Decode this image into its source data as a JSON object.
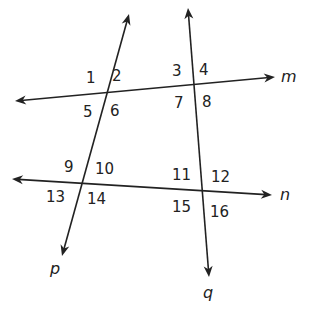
{
  "diagram": {
    "stroke_color": "#222222",
    "background": "#ffffff",
    "lines": [
      {
        "name": "m",
        "label": "m",
        "x1": 15,
        "y1": 101,
        "x2": 275,
        "y2": 77
      },
      {
        "name": "n",
        "label": "n",
        "x1": 12,
        "y1": 179,
        "x2": 272,
        "y2": 195
      },
      {
        "name": "p",
        "label": "p",
        "x1": 129,
        "y1": 14,
        "x2": 62,
        "y2": 256
      },
      {
        "name": "q",
        "label": "q",
        "x1": 188,
        "y1": 8,
        "x2": 209,
        "y2": 277
      }
    ],
    "angle_labels": [
      {
        "n": "1",
        "x": 86,
        "y": 83
      },
      {
        "n": "2",
        "x": 112,
        "y": 81
      },
      {
        "n": "3",
        "x": 172,
        "y": 76
      },
      {
        "n": "4",
        "x": 199,
        "y": 75
      },
      {
        "n": "5",
        "x": 83,
        "y": 117
      },
      {
        "n": "6",
        "x": 110,
        "y": 116
      },
      {
        "n": "7",
        "x": 174,
        "y": 108
      },
      {
        "n": "8",
        "x": 202,
        "y": 107
      },
      {
        "n": "9",
        "x": 64,
        "y": 172
      },
      {
        "n": "10",
        "x": 95,
        "y": 174
      },
      {
        "n": "11",
        "x": 172,
        "y": 180
      },
      {
        "n": "12",
        "x": 211,
        "y": 182
      },
      {
        "n": "13",
        "x": 46,
        "y": 202
      },
      {
        "n": "14",
        "x": 87,
        "y": 204
      },
      {
        "n": "15",
        "x": 172,
        "y": 212
      },
      {
        "n": "16",
        "x": 210,
        "y": 217
      }
    ],
    "line_labels": [
      {
        "text": "m",
        "x": 281,
        "y": 82
      },
      {
        "text": "n",
        "x": 280,
        "y": 200
      },
      {
        "text": "p",
        "x": 50,
        "y": 274
      },
      {
        "text": "q",
        "x": 203,
        "y": 298
      }
    ]
  }
}
